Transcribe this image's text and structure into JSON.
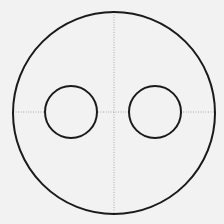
{
  "diagram": {
    "background": "#f2f2f2",
    "stroke_color": "#1a1a1a",
    "guide_color": "#9a9a9a",
    "outer_circle": {
      "cx": 114,
      "cy": 113,
      "r": 101
    },
    "inner_circles": [
      {
        "cx": 71,
        "cy": 112,
        "r": 26
      },
      {
        "cx": 155,
        "cy": 112,
        "r": 26
      }
    ],
    "guides": {
      "vertical_x": 114,
      "horizontal_y": 112
    }
  }
}
